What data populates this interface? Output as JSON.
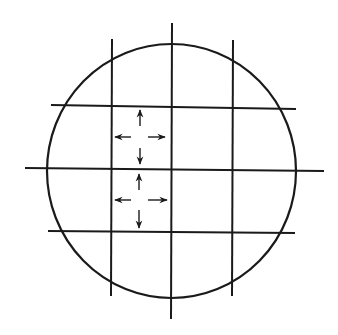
{
  "diagram": {
    "title": "",
    "colors": {
      "background": "#ffffff",
      "ink": "#1a1a1a"
    },
    "circle": {
      "cx": 171.5,
      "cy": 171,
      "rx": 124.5,
      "ry": 127
    },
    "vertical_lines": [
      {
        "x1": 112,
        "y1": 39,
        "x2": 111,
        "y2": 296
      },
      {
        "x1": 172,
        "y1": 23,
        "x2": 171,
        "y2": 319
      },
      {
        "x1": 233,
        "y1": 40,
        "x2": 232,
        "y2": 296
      }
    ],
    "horizontal_lines": [
      {
        "x1": 51,
        "y1": 105,
        "x2": 296,
        "y2": 109
      },
      {
        "x1": 25,
        "y1": 168,
        "x2": 324,
        "y2": 171
      },
      {
        "x1": 48,
        "y1": 231,
        "x2": 295,
        "y2": 233
      }
    ],
    "arrow_groups": [
      {
        "cell": "upper-left-center",
        "arrows": [
          {
            "dir": "up",
            "x1": 140,
            "y1": 126,
            "x2": 140,
            "y2": 110
          },
          {
            "dir": "left",
            "x1": 131,
            "y1": 137,
            "x2": 115,
            "y2": 137
          },
          {
            "dir": "right",
            "x1": 148,
            "y1": 137,
            "x2": 165,
            "y2": 137
          },
          {
            "dir": "down",
            "x1": 140,
            "y1": 148,
            "x2": 140,
            "y2": 164
          }
        ]
      },
      {
        "cell": "lower-left-center",
        "arrows": [
          {
            "dir": "up",
            "x1": 139,
            "y1": 190,
            "x2": 139,
            "y2": 174
          },
          {
            "dir": "left",
            "x1": 131,
            "y1": 200,
            "x2": 115,
            "y2": 200
          },
          {
            "dir": "right",
            "x1": 148,
            "y1": 200,
            "x2": 167,
            "y2": 200
          },
          {
            "dir": "down",
            "x1": 139,
            "y1": 210,
            "x2": 139,
            "y2": 228
          }
        ]
      }
    ]
  }
}
